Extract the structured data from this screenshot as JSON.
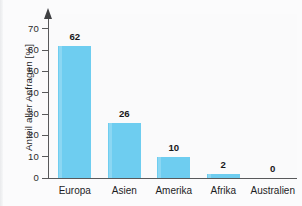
{
  "chart_data": {
    "type": "bar",
    "title": "",
    "xlabel": "",
    "ylabel": "Anteil aller Anfragen [%]",
    "categories": [
      "Europa",
      "Asien",
      "Amerika",
      "Afrika",
      "Australien"
    ],
    "values": [
      62,
      26,
      10,
      2,
      0
    ],
    "value_labels": [
      "62",
      "26",
      "10",
      "2",
      "0"
    ],
    "ylim": [
      0,
      75
    ],
    "yticks": [
      0,
      10,
      20,
      30,
      40,
      50,
      60,
      70
    ],
    "ytick_labels": [
      "0",
      "10",
      "20",
      "30",
      "40",
      "50",
      "60",
      "70"
    ],
    "grid": false,
    "legend": null,
    "bar_color": "#6ecdf0",
    "axis_color": "#58595b",
    "text_color": "#1d1d1f",
    "background": "#fafafb"
  }
}
